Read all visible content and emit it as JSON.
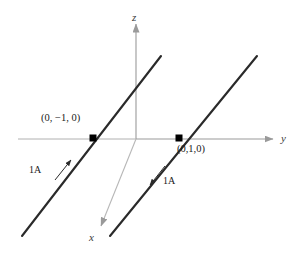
{
  "figure": {
    "background_color": "#ffffff",
    "axis_color": "#9a9a9a",
    "wire_color": "#2a2a2a",
    "marker_color": "#000000",
    "text_color": "#1a1a1a"
  },
  "axes": {
    "z": {
      "label": "z",
      "direction": "up"
    },
    "y": {
      "label": "y",
      "direction": "right"
    },
    "x": {
      "label": "x",
      "direction": "down-left"
    }
  },
  "points": [
    {
      "name": "left-intersection",
      "label": "(0, −1, 0)"
    },
    {
      "name": "right-intersection",
      "label": "(0,1,0)"
    }
  ],
  "currents": [
    {
      "name": "left-wire-current",
      "label": "1A",
      "direction": "up-right"
    },
    {
      "name": "right-wire-current",
      "label": "1A",
      "direction": "down-left"
    }
  ]
}
